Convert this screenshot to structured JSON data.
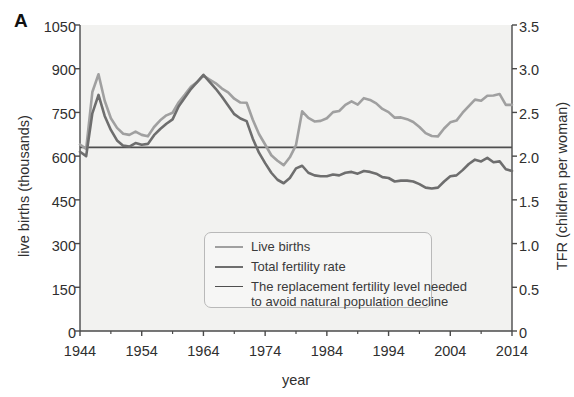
{
  "panel": {
    "label": "A"
  },
  "axes": {
    "left": {
      "title": "live births (thousands)",
      "ticks": [
        "0",
        "150",
        "300",
        "450",
        "600",
        "750",
        "900",
        "1050"
      ],
      "min": 0,
      "max": 1050
    },
    "right": {
      "title": "TFR (children per woman)",
      "ticks": [
        "0",
        "0.5",
        "1.0",
        "1.5",
        "2.0",
        "2.5",
        "3.0",
        "3.5"
      ],
      "min": 0,
      "max": 3.5
    },
    "bottom": {
      "title": "year",
      "ticks": [
        "1944",
        "1954",
        "1964",
        "1974",
        "1984",
        "1994",
        "2004",
        "2014"
      ],
      "min": 1944,
      "max": 2014
    }
  },
  "legend": {
    "position": "inside-bottom-center",
    "items": [
      {
        "label": "Live births",
        "color": "#a0a0a0"
      },
      {
        "label": "Total fertility rate",
        "color": "#6e6e6e"
      },
      {
        "label": "The replacement fertility level needed",
        "label2": "to avoid natural population decline",
        "color": "#4f4f4f"
      }
    ]
  },
  "colors": {
    "live_births": "#a0a0a0",
    "tfr": "#6e6e6e",
    "replacement": "#4f4f4f",
    "axis": "#4a4a4a",
    "plot_background": "#f2f2f0",
    "text": "#2f2f2f"
  },
  "chart_data": {
    "type": "line",
    "title": "",
    "subtitle": "",
    "xlabel": "year",
    "ylabel": "live births (thousands)",
    "ylabel_secondary": "TFR (children per woman)",
    "xlim": [
      1944,
      2014
    ],
    "ylim": [
      0,
      1050
    ],
    "ylim_secondary": [
      0,
      3.5
    ],
    "grid": false,
    "annotations": [],
    "series": [
      {
        "name": "Live births",
        "axis": "left",
        "unit": "thousands",
        "color": "#a0a0a0",
        "x": [
          1944,
          1945,
          1946,
          1947,
          1948,
          1949,
          1950,
          1951,
          1952,
          1953,
          1954,
          1955,
          1956,
          1957,
          1958,
          1959,
          1960,
          1961,
          1962,
          1963,
          1964,
          1965,
          1966,
          1967,
          1968,
          1969,
          1970,
          1971,
          1972,
          1973,
          1974,
          1975,
          1976,
          1977,
          1978,
          1979,
          1980,
          1981,
          1982,
          1983,
          1984,
          1985,
          1986,
          1987,
          1988,
          1989,
          1990,
          1991,
          1992,
          1993,
          1994,
          1995,
          1996,
          1997,
          1998,
          1999,
          2000,
          2001,
          2002,
          2003,
          2004,
          2005,
          2006,
          2007,
          2008,
          2009,
          2010,
          2011,
          2012,
          2013,
          2014
        ],
        "y": [
          640,
          625,
          820,
          881,
          790,
          730,
          697,
          677,
          673,
          684,
          673,
          668,
          700,
          723,
          740,
          749,
          785,
          811,
          839,
          854,
          876,
          863,
          850,
          832,
          819,
          797,
          784,
          783,
          725,
          676,
          640,
          603,
          584,
          569,
          596,
          638,
          754,
          731,
          719,
          721,
          730,
          751,
          755,
          776,
          788,
          777,
          799,
          793,
          781,
          762,
          751,
          732,
          733,
          727,
          717,
          700,
          679,
          669,
          668,
          695,
          716,
          722,
          749,
          772,
          794,
          790,
          807,
          808,
          813,
          776,
          776
        ]
      },
      {
        "name": "Total fertility rate",
        "axis": "right",
        "unit": "children per woman",
        "color": "#6e6e6e",
        "x": [
          1944,
          1945,
          1946,
          1947,
          1948,
          1949,
          1950,
          1951,
          1952,
          1953,
          1954,
          1955,
          1956,
          1957,
          1958,
          1959,
          1960,
          1961,
          1962,
          1963,
          1964,
          1965,
          1966,
          1967,
          1968,
          1969,
          1970,
          1971,
          1972,
          1973,
          1974,
          1975,
          1976,
          1977,
          1978,
          1979,
          1980,
          1981,
          1982,
          1983,
          1984,
          1985,
          1986,
          1987,
          1988,
          1989,
          1990,
          1991,
          1992,
          1993,
          1994,
          1995,
          1996,
          1997,
          1998,
          1999,
          2000,
          2001,
          2002,
          2003,
          2004,
          2005,
          2006,
          2007,
          2008,
          2009,
          2010,
          2011,
          2012,
          2013,
          2014
        ],
        "y": [
          2.05,
          2.0,
          2.49,
          2.7,
          2.46,
          2.3,
          2.18,
          2.12,
          2.11,
          2.15,
          2.13,
          2.14,
          2.24,
          2.31,
          2.37,
          2.42,
          2.57,
          2.67,
          2.77,
          2.85,
          2.93,
          2.85,
          2.77,
          2.68,
          2.58,
          2.48,
          2.43,
          2.4,
          2.2,
          2.04,
          1.92,
          1.81,
          1.73,
          1.69,
          1.75,
          1.86,
          1.89,
          1.81,
          1.78,
          1.77,
          1.77,
          1.79,
          1.78,
          1.81,
          1.82,
          1.8,
          1.83,
          1.82,
          1.8,
          1.76,
          1.75,
          1.71,
          1.72,
          1.72,
          1.71,
          1.68,
          1.64,
          1.63,
          1.64,
          1.71,
          1.77,
          1.78,
          1.84,
          1.91,
          1.96,
          1.94,
          1.98,
          1.93,
          1.94,
          1.85,
          1.83
        ]
      },
      {
        "name": "The replacement fertility level needed to avoid natural population decline",
        "axis": "right",
        "unit": "children per woman",
        "color": "#4f4f4f",
        "constant": 2.1,
        "x": [
          1944,
          2014
        ],
        "y": [
          2.1,
          2.1
        ]
      }
    ]
  }
}
